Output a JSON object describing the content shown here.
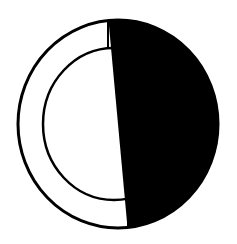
{
  "diagram": {
    "type": "ring",
    "colors": {
      "background": "#ffffff",
      "ink": "#000000",
      "fill": "#000000"
    },
    "outer": {
      "cx": 118,
      "cy": 124,
      "rx": 100,
      "ry": 104
    },
    "inner": {
      "cx": 114,
      "cy": 124,
      "rx": 71,
      "ry": 76
    },
    "fill_region": {
      "side": "right",
      "top_cut_x": 108,
      "bottom_cut_x": 128
    }
  }
}
